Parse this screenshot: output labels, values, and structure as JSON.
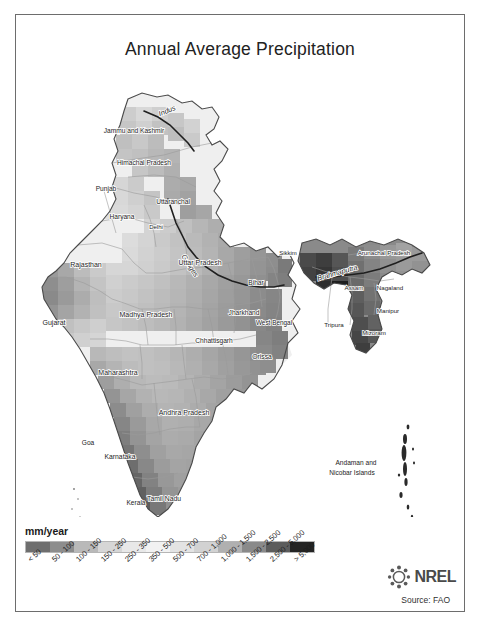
{
  "figure": {
    "title": "Annual Average Precipitation",
    "source": "Source: FAO",
    "logo_text": "NREL",
    "logo_mark": "nrel-starburst-icon",
    "frame_color": "#6d6d6d",
    "background": "#ffffff"
  },
  "legend": {
    "unit": "mm/year",
    "entries": [
      {
        "label": "< 50",
        "color": "#6e6e6e"
      },
      {
        "label": "50 - 100",
        "color": "#8d8d8d"
      },
      {
        "label": "100 - 150",
        "color": "#b9b9b9"
      },
      {
        "label": "150 - 250",
        "color": "#d6d6d6"
      },
      {
        "label": "250 - 350",
        "color": "#e8e8e8"
      },
      {
        "label": "350 - 500",
        "color": "#f2f2f2"
      },
      {
        "label": "500 - 700",
        "color": "#e3e3e3"
      },
      {
        "label": "700 - 1,000",
        "color": "#d2d2d2"
      },
      {
        "label": "1,000 - 1,500",
        "color": "#b0b0b0"
      },
      {
        "label": "1,500 - 2,500",
        "color": "#8a8a8a"
      },
      {
        "label": "2,500 - 5,000",
        "color": "#5c5c5c"
      },
      {
        "label": "> 5,000",
        "color": "#242424"
      }
    ]
  },
  "map": {
    "region": "India",
    "state_labels": [
      {
        "name": "Jammu and Kashmir",
        "x": 118,
        "y": 56,
        "rotate": 0,
        "size": 6.6
      },
      {
        "name": "Himachal Pradesh",
        "x": 128,
        "y": 88,
        "rotate": 0,
        "size": 6.6
      },
      {
        "name": "Punjab",
        "x": 90,
        "y": 114,
        "rotate": 0,
        "size": 6.6
      },
      {
        "name": "Uttaranchal",
        "x": 157,
        "y": 127,
        "rotate": 0,
        "size": 6.6
      },
      {
        "name": "Haryana",
        "x": 106,
        "y": 142,
        "rotate": 0,
        "size": 6.6
      },
      {
        "name": "Delhi",
        "x": 140,
        "y": 152,
        "rotate": 0,
        "size": 6.0
      },
      {
        "name": "Rajasthan",
        "x": 70,
        "y": 190,
        "rotate": 0,
        "size": 7.0
      },
      {
        "name": "Uttar Pradesh",
        "x": 184,
        "y": 188,
        "rotate": 0,
        "size": 7.0
      },
      {
        "name": "Bihar",
        "x": 240,
        "y": 208,
        "rotate": 0,
        "size": 6.6
      },
      {
        "name": "Sikkim",
        "x": 272,
        "y": 178,
        "rotate": 0,
        "size": 6.0
      },
      {
        "name": "Gujarat",
        "x": 38,
        "y": 248,
        "rotate": 0,
        "size": 7.0
      },
      {
        "name": "Madhya Pradesh",
        "x": 130,
        "y": 240,
        "rotate": 0,
        "size": 7.0
      },
      {
        "name": "Jharkhand",
        "x": 228,
        "y": 238,
        "rotate": 0,
        "size": 6.6
      },
      {
        "name": "West Bengal",
        "x": 258,
        "y": 248,
        "rotate": 0,
        "size": 6.4
      },
      {
        "name": "Chhattisgarh",
        "x": 198,
        "y": 266,
        "rotate": 0,
        "size": 6.6
      },
      {
        "name": "Orissa",
        "x": 246,
        "y": 282,
        "rotate": 0,
        "size": 6.8
      },
      {
        "name": "Maharashtra",
        "x": 102,
        "y": 298,
        "rotate": 0,
        "size": 7.0
      },
      {
        "name": "Andhra Pradesh",
        "x": 168,
        "y": 338,
        "rotate": 0,
        "size": 7.0
      },
      {
        "name": "Goa",
        "x": 72,
        "y": 368,
        "rotate": 0,
        "size": 6.6
      },
      {
        "name": "Karnataka",
        "x": 104,
        "y": 382,
        "rotate": 0,
        "size": 6.8
      },
      {
        "name": "Tamil Nadu",
        "x": 148,
        "y": 424,
        "rotate": 0,
        "size": 6.8
      },
      {
        "name": "Kerala",
        "x": 120,
        "y": 428,
        "rotate": 0,
        "size": 6.6
      },
      {
        "name": "Lakshadweep",
        "x": 62,
        "y": 458,
        "rotate": 0,
        "size": 6.6
      },
      {
        "name": "Arunachal Pradesh",
        "x": 368,
        "y": 178,
        "rotate": 0,
        "size": 6.2
      },
      {
        "name": "Assam",
        "x": 338,
        "y": 213,
        "rotate": 0,
        "size": 6.2
      },
      {
        "name": "Nagaland",
        "x": 374,
        "y": 213,
        "rotate": 0,
        "size": 6.2
      },
      {
        "name": "Manipur",
        "x": 372,
        "y": 236,
        "rotate": 0,
        "size": 6.2
      },
      {
        "name": "Mizoram",
        "x": 358,
        "y": 258,
        "rotate": 0,
        "size": 6.2
      },
      {
        "name": "Tripura",
        "x": 318,
        "y": 250,
        "rotate": 0,
        "size": 6.2
      }
    ],
    "island_labels": [
      {
        "name": "Andaman and",
        "x": 340,
        "y": 388,
        "size": 6.6
      },
      {
        "name": "Nicobar Islands",
        "x": 336,
        "y": 398,
        "size": 6.6
      }
    ],
    "river_labels": [
      {
        "name": "Indus",
        "x": 152,
        "y": 36,
        "rotate": -22
      },
      {
        "name": "Ganges",
        "x": 172,
        "y": 190,
        "rotate": 58
      },
      {
        "name": "Brahmaputra",
        "x": 322,
        "y": 198,
        "rotate": -16
      }
    ]
  }
}
